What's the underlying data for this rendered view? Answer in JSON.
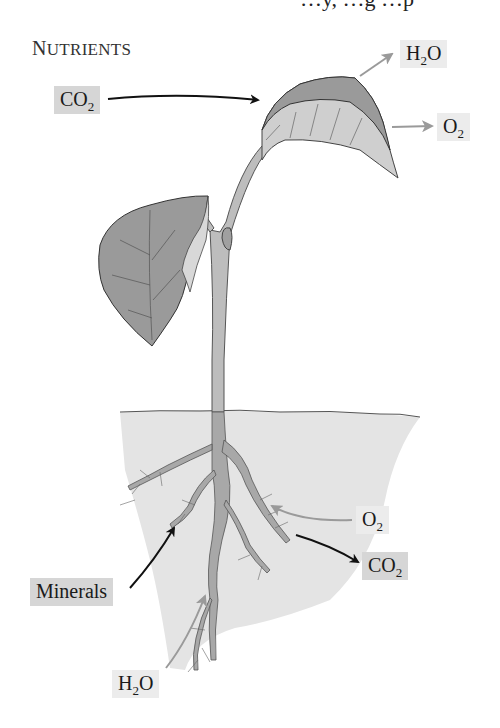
{
  "header": {
    "cut_off_text": "…y, …g …p",
    "title_first": "N",
    "title_rest": "UTRIENTS"
  },
  "labels": {
    "co2_in_leaf": {
      "main": "CO",
      "sub": "2",
      "tail": ""
    },
    "h2o_out_leaf": {
      "main": "H",
      "sub": "2",
      "tail": "O"
    },
    "o2_out_leaf": {
      "main": "O",
      "sub": "2",
      "tail": ""
    },
    "o2_in_root": {
      "main": "O",
      "sub": "2",
      "tail": ""
    },
    "co2_out_root": {
      "main": "CO",
      "sub": "2",
      "tail": ""
    },
    "minerals_in_root": {
      "main": "Minerals"
    },
    "h2o_in_root": {
      "main": "H",
      "sub": "2",
      "tail": "O"
    }
  },
  "colors": {
    "leaf_dark": "#9a9a9a",
    "leaf_light": "#cfcfcf",
    "stem": "#bdbdbd",
    "soil": "#e4e4e4",
    "root": "#a8a8a8",
    "arrow_black": "#111111",
    "arrow_gray": "#9a9a9a",
    "label_dark_bg": "#d6d6d6",
    "label_light_bg": "#ececec"
  }
}
